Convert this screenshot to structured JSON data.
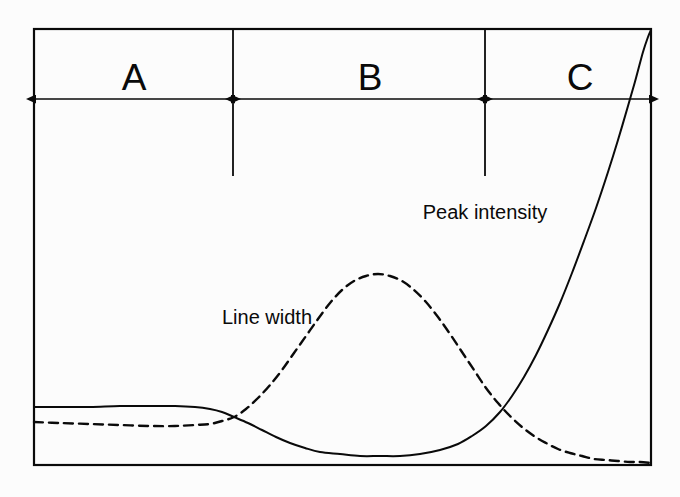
{
  "figure": {
    "type": "line",
    "background_color": "#fcfcfc",
    "ink_color": "#0a0a0a",
    "frame": {
      "left": 34,
      "top": 29,
      "right": 651,
      "bottom": 465
    }
  },
  "regions": {
    "dimension_line_y": 99,
    "items": [
      {
        "id": "A",
        "label": "A",
        "label_x": 134,
        "label_baseline_y": 96,
        "start_x": 34,
        "end_x": 233
      },
      {
        "id": "B",
        "label": "B",
        "label_x": 370,
        "label_baseline_y": 96,
        "start_x": 233,
        "end_x": 485
      },
      {
        "id": "C",
        "label": "C",
        "label_x": 580,
        "label_baseline_y": 96,
        "start_x": 485,
        "end_x": 651
      }
    ],
    "dividers": [
      {
        "x": 233,
        "y_top": 30,
        "y_bottom": 176
      },
      {
        "x": 485,
        "y_top": 30,
        "y_bottom": 176
      }
    ]
  },
  "annotations": {
    "peak_intensity": {
      "text": "Peak intensity",
      "x": 485,
      "y": 202
    },
    "line_width": {
      "text": "Line width",
      "x": 267,
      "y": 307
    }
  },
  "chart_data": {
    "type": "line",
    "title": "",
    "xlabel": "",
    "ylabel": "",
    "grid": false,
    "legend": "inline-labels",
    "axis_ticks": false,
    "xlim": [
      34,
      651
    ],
    "ylim": [
      465,
      29
    ],
    "annotations": [
      "A",
      "B",
      "C",
      "Peak intensity",
      "Line width"
    ],
    "series": [
      {
        "name": "Peak intensity",
        "style": "solid",
        "color": "#0a0a0a",
        "width": 2,
        "points": [
          [
            34,
            407
          ],
          [
            60,
            407
          ],
          [
            90,
            407
          ],
          [
            120,
            406
          ],
          [
            150,
            406
          ],
          [
            175,
            406
          ],
          [
            195,
            407
          ],
          [
            210,
            409
          ],
          [
            222,
            412
          ],
          [
            234,
            417
          ],
          [
            248,
            423
          ],
          [
            262,
            430
          ],
          [
            276,
            437
          ],
          [
            290,
            443
          ],
          [
            305,
            448
          ],
          [
            320,
            452
          ],
          [
            340,
            454
          ],
          [
            360,
            456
          ],
          [
            380,
            456
          ],
          [
            400,
            456
          ],
          [
            420,
            454
          ],
          [
            440,
            450
          ],
          [
            458,
            444
          ],
          [
            472,
            436
          ],
          [
            486,
            426
          ],
          [
            500,
            412
          ],
          [
            512,
            396
          ],
          [
            524,
            377
          ],
          [
            536,
            355
          ],
          [
            548,
            330
          ],
          [
            560,
            303
          ],
          [
            572,
            273
          ],
          [
            584,
            241
          ],
          [
            596,
            208
          ],
          [
            608,
            172
          ],
          [
            618,
            140
          ],
          [
            628,
            106
          ],
          [
            636,
            78
          ],
          [
            643,
            52
          ],
          [
            648,
            37
          ],
          [
            651,
            30
          ]
        ]
      },
      {
        "name": "Line width",
        "style": "dashed",
        "color": "#0a0a0a",
        "width": 2.4,
        "dash": "9 6",
        "points": [
          [
            34,
            422
          ],
          [
            60,
            423
          ],
          [
            90,
            424
          ],
          [
            120,
            425
          ],
          [
            150,
            426
          ],
          [
            175,
            426
          ],
          [
            195,
            425
          ],
          [
            210,
            424
          ],
          [
            222,
            421
          ],
          [
            234,
            417
          ],
          [
            246,
            409
          ],
          [
            258,
            398
          ],
          [
            270,
            385
          ],
          [
            282,
            370
          ],
          [
            294,
            353
          ],
          [
            306,
            336
          ],
          [
            318,
            319
          ],
          [
            330,
            303
          ],
          [
            342,
            290
          ],
          [
            354,
            281
          ],
          [
            366,
            276
          ],
          [
            378,
            274
          ],
          [
            390,
            276
          ],
          [
            402,
            281
          ],
          [
            414,
            290
          ],
          [
            426,
            302
          ],
          [
            438,
            317
          ],
          [
            450,
            334
          ],
          [
            462,
            352
          ],
          [
            474,
            370
          ],
          [
            486,
            388
          ],
          [
            498,
            403
          ],
          [
            510,
            416
          ],
          [
            522,
            427
          ],
          [
            534,
            436
          ],
          [
            546,
            443
          ],
          [
            558,
            449
          ],
          [
            570,
            453
          ],
          [
            582,
            456
          ],
          [
            594,
            459
          ],
          [
            606,
            460
          ],
          [
            618,
            461
          ],
          [
            630,
            462
          ],
          [
            640,
            462
          ],
          [
            651,
            463
          ]
        ]
      }
    ]
  }
}
